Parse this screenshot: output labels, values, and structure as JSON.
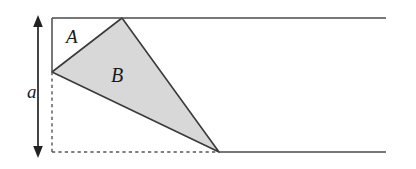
{
  "figure": {
    "canvas": {
      "width": 416,
      "height": 169,
      "background": "#ffffff"
    },
    "title": "",
    "labels": {
      "region_a": "A",
      "region_b": "B",
      "dimension_a": "a"
    },
    "colors": {
      "shaded_fill": "#d8d8d8",
      "stroke": "#4a4a4a",
      "triangle_stroke": "#3a3a3a",
      "arrow": "#222222",
      "dashed": "#555555",
      "text": "#1a1a1a"
    },
    "geometry": {
      "top_line": {
        "x1": 52,
        "y1": 18,
        "x2": 386,
        "y2": 18,
        "style": "solid"
      },
      "left_solid_vertical": {
        "x1": 52,
        "y1": 18,
        "x2": 52,
        "y2": 72,
        "style": "solid"
      },
      "left_dashed_vertical": {
        "x1": 52,
        "y1": 72,
        "x2": 52,
        "y2": 152,
        "style": "dashed"
      },
      "bottom_dashed_line": {
        "x1": 52,
        "y1": 152,
        "x2": 219,
        "y2": 152,
        "style": "dashed"
      },
      "bottom_solid_line": {
        "x1": 219,
        "y1": 152,
        "x2": 386,
        "y2": 152,
        "style": "solid"
      },
      "triangle_b": {
        "points": "52,72 122,18 219,152",
        "fill": "#d8d8d8"
      },
      "dimension_arrow": {
        "x": 38,
        "y_top": 17,
        "y_bottom": 156,
        "heads": "both"
      }
    },
    "icons": {
      "dimension_arrow": "double-headed-arrow-icon"
    }
  }
}
